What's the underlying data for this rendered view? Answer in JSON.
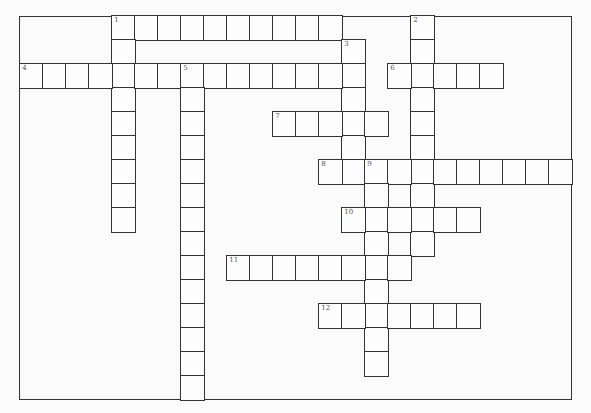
{
  "puzzle": {
    "type": "crossword",
    "grid": {
      "origin_x": 20,
      "origin_y": 16,
      "cell_w": 23,
      "cell_h": 24,
      "cols": 24,
      "rows": 16
    },
    "entries": [
      {
        "number": "1",
        "direction": "across",
        "row": 0,
        "col": 4,
        "length": 10
      },
      {
        "number": "1",
        "direction": "down",
        "row": 0,
        "col": 4,
        "length": 9
      },
      {
        "number": "2",
        "direction": "down",
        "row": 0,
        "col": 17,
        "length": 10
      },
      {
        "number": "3",
        "direction": "down",
        "row": 1,
        "col": 14,
        "length": 6
      },
      {
        "number": "4",
        "direction": "across",
        "row": 2,
        "col": 0,
        "length": 15
      },
      {
        "number": "5",
        "direction": "down",
        "row": 2,
        "col": 7,
        "length": 14
      },
      {
        "number": "6",
        "direction": "across",
        "row": 2,
        "col": 16,
        "length": 5
      },
      {
        "number": "7",
        "direction": "across",
        "row": 4,
        "col": 11,
        "length": 5
      },
      {
        "number": "8",
        "direction": "across",
        "row": 6,
        "col": 13,
        "length": 11
      },
      {
        "number": "9",
        "direction": "down",
        "row": 6,
        "col": 15,
        "length": 9
      },
      {
        "number": "10",
        "direction": "across",
        "row": 8,
        "col": 14,
        "length": 6
      },
      {
        "number": "11",
        "direction": "across",
        "row": 10,
        "col": 9,
        "length": 8
      },
      {
        "number": "12",
        "direction": "across",
        "row": 12,
        "col": 13,
        "length": 7
      }
    ]
  }
}
